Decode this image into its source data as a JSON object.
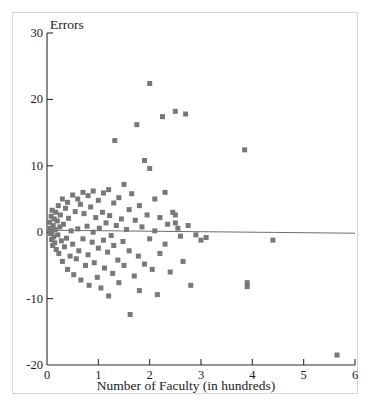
{
  "chart_data": {
    "type": "scatter",
    "title": "",
    "xlabel": "Number of Faculty (in hundreds)",
    "ylabel": "Errors",
    "xlim": [
      0,
      6
    ],
    "ylim": [
      -20,
      30
    ],
    "xticks": [
      0,
      1,
      2,
      3,
      4,
      5,
      6
    ],
    "yticks": [
      -20,
      -10,
      0,
      10,
      20,
      30
    ],
    "xticklabels": [
      "0",
      "1",
      "2",
      "3",
      "4",
      "5",
      "6"
    ],
    "yticklabels": [
      "-20",
      "-10",
      "0",
      "10",
      "20",
      "30"
    ],
    "grid": false,
    "legend": null,
    "marker": {
      "shape": "square",
      "color": "#787878",
      "size_px": 5
    },
    "reference_line": {
      "label": "regression line at approximately zero errors",
      "color": "#6e6e6e",
      "x_start": 0.0,
      "y_start": 0.3,
      "x_end": 6.0,
      "y_end": -0.15
    },
    "points": [
      [
        0.05,
        1.5
      ],
      [
        0.06,
        0.6
      ],
      [
        0.07,
        -0.2
      ],
      [
        0.08,
        2.4
      ],
      [
        0.09,
        -1.1
      ],
      [
        0.1,
        3.3
      ],
      [
        0.1,
        0.1
      ],
      [
        0.11,
        -2.0
      ],
      [
        0.12,
        1.0
      ],
      [
        0.13,
        -0.7
      ],
      [
        0.14,
        2.0
      ],
      [
        0.15,
        -1.6
      ],
      [
        0.16,
        0.4
      ],
      [
        0.17,
        3.0
      ],
      [
        0.18,
        -2.6
      ],
      [
        0.2,
        1.7
      ],
      [
        0.21,
        -0.4
      ],
      [
        0.22,
        4.0
      ],
      [
        0.23,
        -3.2
      ],
      [
        0.25,
        0.8
      ],
      [
        0.26,
        2.6
      ],
      [
        0.28,
        -1.3
      ],
      [
        0.3,
        5.0
      ],
      [
        0.3,
        -4.4
      ],
      [
        0.32,
        1.2
      ],
      [
        0.34,
        -2.2
      ],
      [
        0.36,
        3.6
      ],
      [
        0.38,
        -0.9
      ],
      [
        0.4,
        4.5
      ],
      [
        0.4,
        -5.6
      ],
      [
        0.42,
        2.1
      ],
      [
        0.45,
        -3.6
      ],
      [
        0.47,
        0.2
      ],
      [
        0.5,
        5.6
      ],
      [
        0.5,
        -1.8
      ],
      [
        0.52,
        -6.4
      ],
      [
        0.55,
        3.1
      ],
      [
        0.57,
        -4.0
      ],
      [
        0.6,
        5.0
      ],
      [
        0.6,
        0.5
      ],
      [
        0.62,
        -2.8
      ],
      [
        0.65,
        4.2
      ],
      [
        0.66,
        -7.2
      ],
      [
        0.7,
        6.0
      ],
      [
        0.7,
        -1.0
      ],
      [
        0.72,
        2.8
      ],
      [
        0.75,
        -5.0
      ],
      [
        0.78,
        0.9
      ],
      [
        0.8,
        5.5
      ],
      [
        0.8,
        -3.4
      ],
      [
        0.82,
        -8.0
      ],
      [
        0.85,
        3.8
      ],
      [
        0.88,
        -1.5
      ],
      [
        0.9,
        6.2
      ],
      [
        0.9,
        0.0
      ],
      [
        0.92,
        -4.6
      ],
      [
        0.95,
        2.2
      ],
      [
        0.98,
        -6.8
      ],
      [
        1.0,
        4.8
      ],
      [
        1.0,
        -2.4
      ],
      [
        1.02,
        0.6
      ],
      [
        1.05,
        -8.4
      ],
      [
        1.08,
        3.0
      ],
      [
        1.1,
        5.9
      ],
      [
        1.1,
        -1.2
      ],
      [
        1.12,
        -5.4
      ],
      [
        1.15,
        1.4
      ],
      [
        1.18,
        -3.0
      ],
      [
        1.2,
        6.4
      ],
      [
        1.2,
        -9.6
      ],
      [
        1.22,
        2.5
      ],
      [
        1.25,
        -0.5
      ],
      [
        1.28,
        -6.2
      ],
      [
        1.3,
        4.4
      ],
      [
        1.3,
        -2.0
      ],
      [
        1.32,
        13.8
      ],
      [
        1.35,
        1.0
      ],
      [
        1.38,
        -4.2
      ],
      [
        1.4,
        5.2
      ],
      [
        1.4,
        -7.6
      ],
      [
        1.45,
        2.0
      ],
      [
        1.48,
        -1.4
      ],
      [
        1.5,
        7.2
      ],
      [
        1.5,
        -5.0
      ],
      [
        1.55,
        0.4
      ],
      [
        1.6,
        3.4
      ],
      [
        1.6,
        -2.8
      ],
      [
        1.62,
        -12.4
      ],
      [
        1.65,
        5.8
      ],
      [
        1.7,
        -6.6
      ],
      [
        1.72,
        1.8
      ],
      [
        1.75,
        16.2
      ],
      [
        1.78,
        -3.6
      ],
      [
        1.8,
        4.0
      ],
      [
        1.8,
        -8.8
      ],
      [
        1.85,
        0.8
      ],
      [
        1.9,
        10.8
      ],
      [
        1.9,
        -4.8
      ],
      [
        1.95,
        2.6
      ],
      [
        2.0,
        22.4
      ],
      [
        2.0,
        9.6
      ],
      [
        2.0,
        -1.0
      ],
      [
        2.05,
        -5.6
      ],
      [
        2.1,
        5.0
      ],
      [
        2.1,
        0.2
      ],
      [
        2.15,
        -9.4
      ],
      [
        2.2,
        2.2
      ],
      [
        2.2,
        -3.2
      ],
      [
        2.25,
        17.4
      ],
      [
        2.3,
        6.0
      ],
      [
        2.3,
        -1.8
      ],
      [
        2.35,
        1.2
      ],
      [
        2.4,
        -6.0
      ],
      [
        2.45,
        3.0
      ],
      [
        2.5,
        18.2
      ],
      [
        2.5,
        2.6
      ],
      [
        2.5,
        1.4
      ],
      [
        2.55,
        0.6
      ],
      [
        2.6,
        -0.6
      ],
      [
        2.65,
        -4.4
      ],
      [
        2.7,
        17.8
      ],
      [
        2.75,
        1.0
      ],
      [
        2.8,
        -8.0
      ],
      [
        2.9,
        -0.4
      ],
      [
        3.0,
        -1.2
      ],
      [
        3.1,
        -0.8
      ],
      [
        3.85,
        12.4
      ],
      [
        3.9,
        -7.6
      ],
      [
        3.9,
        -8.2
      ],
      [
        4.4,
        -1.2
      ],
      [
        5.65,
        -18.5
      ]
    ]
  }
}
